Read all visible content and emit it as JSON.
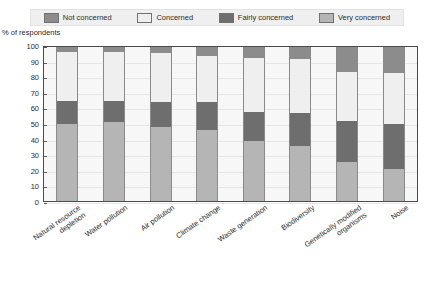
{
  "title": "",
  "axis": {
    "ylabel": "% of respondents",
    "yticks": [
      100,
      90,
      80,
      70,
      60,
      50,
      40,
      30,
      20,
      10,
      0
    ]
  },
  "legend": {
    "position": "top",
    "items": [
      {
        "label": "Not concerned",
        "color": "#8c8c8c"
      },
      {
        "label": "Concerned",
        "color": "#efefef"
      },
      {
        "label": "Fairly concerned",
        "color": "#6e6e6e"
      },
      {
        "label": "Very concerned",
        "color": "#b5b5b5"
      }
    ]
  },
  "chart_data": {
    "type": "bar",
    "stacked": true,
    "stack_total": 100,
    "title": "",
    "xlabel": "",
    "ylabel": "% of respondents",
    "ylim": [
      0,
      100
    ],
    "ytick_step": 10,
    "grid": true,
    "legend_position": "top",
    "categories": [
      "Natural resource depletion",
      "Water pollution",
      "Air pollution",
      "Climate change",
      "Waste generation",
      "Biodiversity",
      "Genetically modified organisms",
      "Noise"
    ],
    "category_lines": [
      [
        "Natural resource",
        "depletion"
      ],
      [
        "Water pollution"
      ],
      [
        "Air pollution"
      ],
      [
        "Climate change"
      ],
      [
        "Waste generation"
      ],
      [
        "Biodiversity"
      ],
      [
        "Genetically modified",
        "organisms"
      ],
      [
        "Noise"
      ]
    ],
    "series": [
      {
        "name": "Very concerned",
        "color": "#b5b5b5",
        "values": [
          50,
          51,
          48,
          46,
          39,
          36,
          25,
          21
        ]
      },
      {
        "name": "Fairly concerned",
        "color": "#6e6e6e",
        "values": [
          15,
          14,
          16,
          18,
          19,
          21,
          27,
          29
        ]
      },
      {
        "name": "Concerned",
        "color": "#efefef",
        "values": [
          32,
          32,
          32,
          30,
          35,
          35,
          32,
          33
        ]
      },
      {
        "name": "Not concerned",
        "color": "#8c8c8c",
        "values": [
          3,
          3,
          4,
          6,
          7,
          8,
          16,
          17
        ]
      }
    ]
  }
}
